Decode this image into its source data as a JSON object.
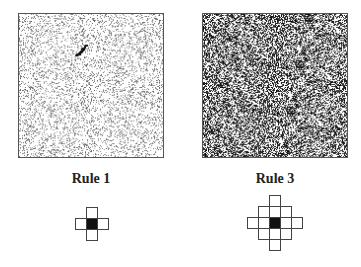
{
  "panels": [
    {
      "label": "Rule 1",
      "density": 0.22,
      "tone": "light",
      "has_cluster": true
    },
    {
      "label": "Rule 3",
      "density": 0.52,
      "tone": "dark",
      "has_cluster": false
    }
  ],
  "stencils": [
    {
      "label": "Rule 1",
      "radius": 1,
      "cells": [
        [
          0,
          -1
        ],
        [
          -1,
          0
        ],
        [
          0,
          0
        ],
        [
          1,
          0
        ],
        [
          0,
          1
        ]
      ]
    },
    {
      "label": "Rule 3",
      "radius": 2,
      "cells": [
        [
          0,
          -2
        ],
        [
          -1,
          -1
        ],
        [
          0,
          -1
        ],
        [
          1,
          -1
        ],
        [
          -2,
          0
        ],
        [
          -1,
          0
        ],
        [
          0,
          0
        ],
        [
          1,
          0
        ],
        [
          2,
          0
        ],
        [
          -1,
          1
        ],
        [
          0,
          1
        ],
        [
          1,
          1
        ],
        [
          0,
          2
        ]
      ]
    }
  ],
  "colors": {
    "ink": "#222222",
    "center": "#111111",
    "border": "#444444"
  }
}
